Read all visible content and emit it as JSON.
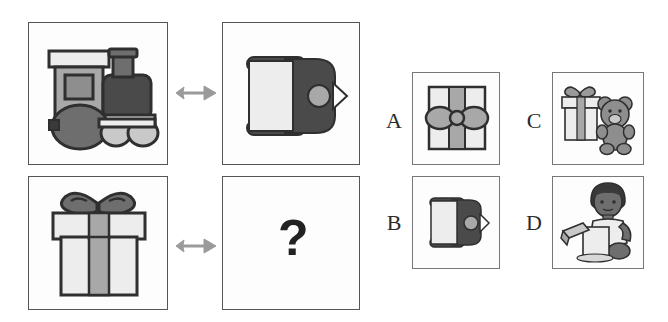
{
  "puzzle": {
    "type": "visual-analogy-matrix",
    "question_symbol": "?",
    "prompt_rows": [
      {
        "id": "row-1",
        "source": {
          "object": "toy-train",
          "view": "side-view"
        },
        "relation": "rotate-to-top-view",
        "target": {
          "object": "toy-train",
          "view": "top-view"
        }
      },
      {
        "id": "row-2",
        "source": {
          "object": "gift-box",
          "view": "side-view"
        },
        "relation": "rotate-to-top-view",
        "target": {
          "object": "unknown",
          "view": "top-view"
        }
      }
    ],
    "options": [
      {
        "letter": "A",
        "object": "gift-box",
        "view": "top-view",
        "description": "Gift box seen from above with ribbon bow"
      },
      {
        "letter": "B",
        "object": "toy-train",
        "view": "top-view",
        "description": "Toy train seen from above"
      },
      {
        "letter": "C",
        "object": "gift-box-and-teddy-bear",
        "view": "side-view",
        "description": "Gift box next to a teddy bear"
      },
      {
        "letter": "D",
        "object": "child-opening-gift",
        "view": "side-view",
        "description": "Child unwrapping a present"
      }
    ],
    "correct_answer": "A"
  },
  "colors": {
    "outline": "#2f2f2f",
    "panel_border": "#555555",
    "option_border": "#777777",
    "arrow": "#9a9a9a",
    "light_gray": "#e2e2e2",
    "pale_gray": "#ededed",
    "mid_gray": "#a8a8a8",
    "dark_gray": "#6e6e6e",
    "darkest": "#4a4a4a",
    "near_black": "#3a3a3a",
    "background": "#ffffff"
  },
  "layout": {
    "panels": [
      {
        "name": "prompt-panel-train-side",
        "x": 28,
        "y": 22,
        "w": 140,
        "h": 143
      },
      {
        "name": "prompt-panel-train-top",
        "x": 222,
        "y": 22,
        "w": 138,
        "h": 143
      },
      {
        "name": "prompt-panel-gift-side",
        "x": 28,
        "y": 176,
        "w": 140,
        "h": 134
      },
      {
        "name": "prompt-panel-answer-slot",
        "x": 222,
        "y": 176,
        "w": 138,
        "h": 134
      }
    ],
    "options": [
      {
        "name": "option-panel-a",
        "x": 412,
        "y": 72,
        "w": 88,
        "h": 93
      },
      {
        "name": "option-panel-b",
        "x": 412,
        "y": 176,
        "w": 88,
        "h": 93
      },
      {
        "name": "option-panel-c",
        "x": 552,
        "y": 72,
        "w": 92,
        "h": 93
      },
      {
        "name": "option-panel-d",
        "x": 552,
        "y": 176,
        "w": 92,
        "h": 93
      }
    ],
    "letters": [
      {
        "name": "option-letter-a",
        "x": 382,
        "y": 110
      },
      {
        "name": "option-letter-b",
        "x": 382,
        "y": 212
      },
      {
        "name": "option-letter-c",
        "x": 522,
        "y": 110
      },
      {
        "name": "option-letter-d",
        "x": 522,
        "y": 212
      }
    ],
    "arrows": [
      {
        "name": "relation-arrow-row-1",
        "x": 174,
        "y": 83
      },
      {
        "name": "relation-arrow-row-2",
        "x": 174,
        "y": 236
      }
    ],
    "question_mark": {
      "x": 278,
      "y": 213
    }
  }
}
